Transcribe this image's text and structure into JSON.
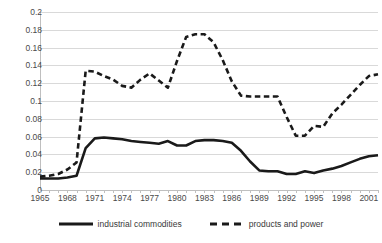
{
  "chart_data": {
    "type": "line",
    "title": "",
    "xlabel": "",
    "ylabel": "",
    "xlim": [
      1965,
      2002
    ],
    "ylim": [
      0,
      0.2
    ],
    "grid": true,
    "legend_position": "bottom",
    "x": [
      1965,
      1966,
      1967,
      1968,
      1969,
      1970,
      1971,
      1972,
      1973,
      1974,
      1975,
      1976,
      1977,
      1978,
      1979,
      1980,
      1981,
      1982,
      1983,
      1984,
      1985,
      1986,
      1987,
      1988,
      1989,
      1990,
      1991,
      1992,
      1993,
      1994,
      1995,
      1996,
      1997,
      1998,
      1999,
      2000,
      2001,
      2002
    ],
    "y_ticks": [
      0,
      0.02,
      0.04,
      0.06,
      0.08,
      0.1,
      0.12,
      0.14,
      0.16,
      0.18,
      0.2
    ],
    "y_tick_labels": [
      "0",
      "0.02",
      "0.04",
      "0.06",
      "0.08",
      "0.1",
      "0.12",
      "0.14",
      "0.16",
      "0.18",
      "0.2"
    ],
    "x_tick_labels": [
      "1965",
      "1968",
      "1971",
      "1974",
      "1977",
      "1980",
      "1983",
      "1986",
      "1989",
      "1992",
      "1995",
      "1998",
      "2001"
    ],
    "x_tick_label_years": [
      1965,
      1968,
      1971,
      1974,
      1977,
      1980,
      1983,
      1986,
      1989,
      1992,
      1995,
      1998,
      2001
    ],
    "series": [
      {
        "name": "industrial commodities",
        "style": "solid",
        "color": "#1a1a1a",
        "width": 2.6,
        "values": [
          0.013,
          0.013,
          0.013,
          0.014,
          0.016,
          0.047,
          0.058,
          0.059,
          0.058,
          0.057,
          0.055,
          0.054,
          0.053,
          0.052,
          0.055,
          0.05,
          0.05,
          0.055,
          0.056,
          0.056,
          0.055,
          0.053,
          0.044,
          0.032,
          0.022,
          0.021,
          0.021,
          0.018,
          0.018,
          0.021,
          0.019,
          0.022,
          0.024,
          0.027,
          0.031,
          0.035,
          0.038,
          0.039
        ]
      },
      {
        "name": "products and power",
        "style": "dashed",
        "color": "#1a1a1a",
        "width": 2.6,
        "values": [
          0.015,
          0.016,
          0.018,
          0.023,
          0.031,
          0.134,
          0.133,
          0.128,
          0.124,
          0.117,
          0.115,
          0.124,
          0.131,
          0.123,
          0.115,
          0.145,
          0.172,
          0.175,
          0.175,
          0.166,
          0.146,
          0.122,
          0.106,
          0.105,
          0.105,
          0.105,
          0.105,
          0.082,
          0.061,
          0.061,
          0.072,
          0.071,
          0.086,
          0.096,
          0.107,
          0.118,
          0.128,
          0.13
        ]
      }
    ]
  },
  "legend": {
    "items": [
      {
        "label": "industrial commodities",
        "style": "solid"
      },
      {
        "label": "products and power",
        "style": "dashed"
      }
    ]
  }
}
